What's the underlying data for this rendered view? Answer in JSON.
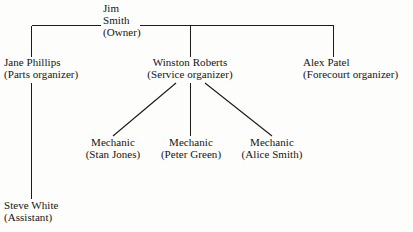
{
  "diagram": {
    "type": "organization-chart",
    "background_color": "#fdfdfb",
    "line_color": "#1a1a1a",
    "text_color": "#141414"
  },
  "nodes": {
    "owner": {
      "name": "Jim Smith",
      "name_line_1": "Jim",
      "name_line_2": "Smith",
      "role": "(Owner)"
    },
    "parts": {
      "name": "Jane Phillips",
      "role": "(Parts organizer)"
    },
    "service": {
      "name": "Winston Roberts",
      "role": "(Service organizer)"
    },
    "forecourt": {
      "name": "Alex Patel",
      "role": "(Forecourt organizer)"
    },
    "mechanic_1": {
      "name": "Mechanic",
      "role": "(Stan Jones)"
    },
    "mechanic_2": {
      "name": "Mechanic",
      "role": "(Peter Green)"
    },
    "mechanic_3": {
      "name": "Mechanic",
      "role": "(Alice Smith)"
    },
    "assistant": {
      "name": "Steve White",
      "role": "(Assistant)"
    }
  },
  "edges": [
    {
      "from": "owner",
      "to": "parts"
    },
    {
      "from": "owner",
      "to": "service"
    },
    {
      "from": "owner",
      "to": "forecourt"
    },
    {
      "from": "service",
      "to": "mechanic_1"
    },
    {
      "from": "service",
      "to": "mechanic_2"
    },
    {
      "from": "service",
      "to": "mechanic_3"
    },
    {
      "from": "parts",
      "to": "assistant"
    }
  ]
}
